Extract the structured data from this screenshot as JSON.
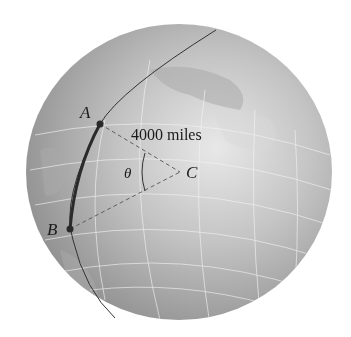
{
  "figure": {
    "labels": {
      "point_a": "A",
      "point_b": "B",
      "point_c": "C",
      "angle": "θ",
      "distance": "4000 miles"
    },
    "colors": {
      "globe_light": "#e2e2e2",
      "globe_mid": "#b8b8b8",
      "globe_dark": "#8a8a8a",
      "grid": "#f0f0f0",
      "arc": "#2a2a2a",
      "meridian": "#333333",
      "dash": "#555555"
    }
  }
}
